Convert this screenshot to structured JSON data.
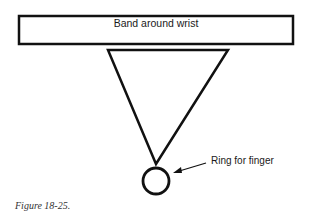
{
  "diagram": {
    "band_label": "Band around wrist",
    "ring_label": "Ring for finger",
    "caption": "Figure 18-25."
  }
}
